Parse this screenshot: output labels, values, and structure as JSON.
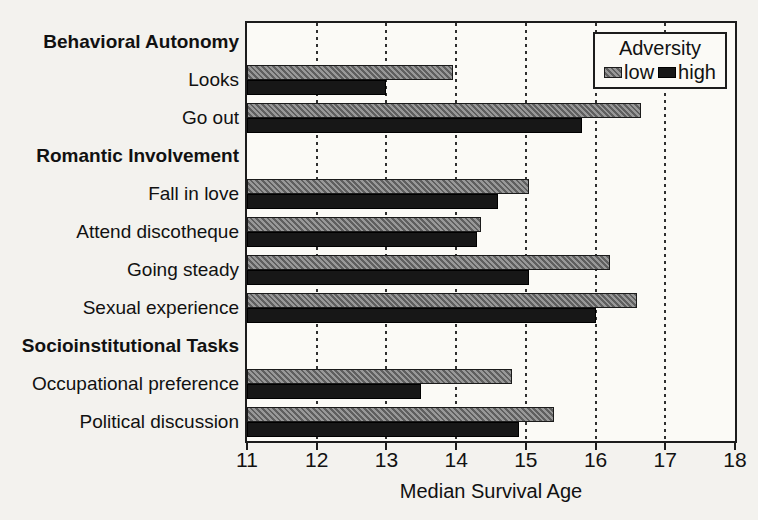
{
  "chart_data": {
    "type": "bar",
    "orientation": "horizontal",
    "title": "",
    "xlabel": "Median Survival Age",
    "xlim": [
      11,
      18
    ],
    "xticks": [
      11,
      12,
      13,
      14,
      15,
      16,
      17,
      18
    ],
    "grid": "vertical-dotted",
    "legend": {
      "title": "Adversity",
      "position": "top-right",
      "entries": [
        {
          "label": "low",
          "style": "gray-hatched"
        },
        {
          "label": "high",
          "style": "black"
        }
      ]
    },
    "categories": [
      "Looks",
      "Go out",
      "Fall in love",
      "Attend discotheque",
      "Going steady",
      "Sexual experience",
      "Occupational preference",
      "Political discussion"
    ],
    "series": [
      {
        "name": "low",
        "values": [
          13.95,
          16.65,
          15.05,
          14.35,
          16.2,
          16.6,
          14.8,
          15.4
        ]
      },
      {
        "name": "high",
        "values": [
          13.0,
          15.8,
          14.6,
          14.3,
          15.05,
          16.0,
          13.5,
          14.9
        ]
      }
    ],
    "rows": [
      {
        "type": "header",
        "label": "Behavioral Autonomy"
      },
      {
        "type": "item",
        "label": "Looks",
        "low": 13.95,
        "high": 13.0
      },
      {
        "type": "item",
        "label": "Go out",
        "low": 16.65,
        "high": 15.8
      },
      {
        "type": "header",
        "label": "Romantic Involvement"
      },
      {
        "type": "item",
        "label": "Fall in love",
        "low": 15.05,
        "high": 14.6
      },
      {
        "type": "item",
        "label": "Attend discotheque",
        "low": 14.35,
        "high": 14.3
      },
      {
        "type": "item",
        "label": "Going steady",
        "low": 16.2,
        "high": 15.05
      },
      {
        "type": "item",
        "label": "Sexual experience",
        "low": 16.6,
        "high": 16.0
      },
      {
        "type": "header",
        "label": "Socioinstitutional Tasks"
      },
      {
        "type": "item",
        "label": "Occupational preference",
        "low": 14.8,
        "high": 13.5
      },
      {
        "type": "item",
        "label": "Political discussion",
        "low": 15.4,
        "high": 14.9
      }
    ],
    "colors": {
      "low_fill": "#989898",
      "low_hatch": "#5f5f5f",
      "high_fill": "#171717",
      "bar_border": "#1b1b1b",
      "axis": "#1c1c1c",
      "background": "#f3f2ee",
      "plot_background": "#fbfaf6"
    }
  }
}
